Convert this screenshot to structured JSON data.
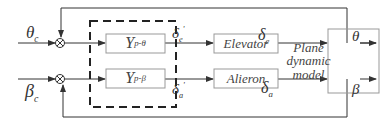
{
  "diagram": {
    "type": "control-block-diagram",
    "inputs": [
      {
        "id": "theta_c",
        "symbol": "θ",
        "sub": "c"
      },
      {
        "id": "beta_c",
        "symbol": "β",
        "sub": "c"
      }
    ],
    "controllers": [
      {
        "id": "Y_p_theta",
        "symbol": "Y",
        "sub": "p-θ"
      },
      {
        "id": "Y_p_beta",
        "symbol": "Y",
        "sub": "p-β"
      }
    ],
    "controller_outputs": [
      {
        "id": "delta_e_prime",
        "symbol": "δ",
        "sub": "e",
        "sup": "'"
      },
      {
        "id": "delta_a_prime",
        "symbol": "δ",
        "sub": "a",
        "sup": "'"
      }
    ],
    "actuators": [
      {
        "id": "elevator",
        "label": "Elevator"
      },
      {
        "id": "alieron",
        "label": "Alieron"
      }
    ],
    "actuator_outputs": [
      {
        "id": "delta_e",
        "symbol": "δ",
        "sub": "e"
      },
      {
        "id": "delta_a",
        "symbol": "δ",
        "sub": "a"
      }
    ],
    "plant": {
      "label_lines": [
        "Plane",
        "dynamic",
        "model"
      ]
    },
    "outputs": [
      {
        "id": "theta",
        "symbol": "θ"
      },
      {
        "id": "beta",
        "symbol": "β"
      }
    ]
  }
}
